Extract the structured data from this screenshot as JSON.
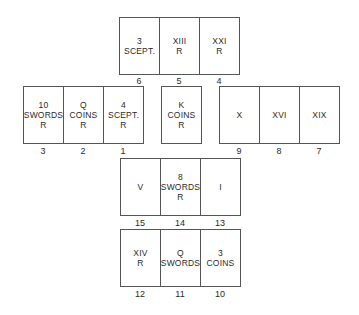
{
  "spread": {
    "top_row": {
      "cards": [
        {
          "position": "6",
          "text": "3\nSCEPT."
        },
        {
          "position": "5",
          "text": "XIII\nR"
        },
        {
          "position": "4",
          "text": "XXI\nR"
        }
      ]
    },
    "left_row": {
      "cards": [
        {
          "position": "3",
          "text": "10\nSWORDS\nR"
        },
        {
          "position": "2",
          "text": "Q\nCOINS\nR"
        },
        {
          "position": "1",
          "text": "4\nSCEPT.\nR"
        }
      ]
    },
    "center_card": {
      "text": "K\nCOINS\nR"
    },
    "right_row": {
      "cards": [
        {
          "position": "9",
          "text": "X"
        },
        {
          "position": "8",
          "text": "XVI"
        },
        {
          "position": "7",
          "text": "XIX"
        }
      ]
    },
    "lower_row": {
      "cards": [
        {
          "position": "15",
          "text": "V"
        },
        {
          "position": "14",
          "text": "8\nSWORDS\nR"
        },
        {
          "position": "13",
          "text": "I"
        }
      ]
    },
    "bottom_row": {
      "cards": [
        {
          "position": "12",
          "text": "XIV\nR"
        },
        {
          "position": "11",
          "text": "Q\nSWORDS"
        },
        {
          "position": "10",
          "text": "3\nCOINS"
        }
      ]
    }
  }
}
